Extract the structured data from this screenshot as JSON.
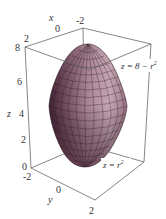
{
  "figure": {
    "surface_color": "#a07888",
    "surface_highlight": "#c7a6b4",
    "surface_shadow": "#4a2a3c",
    "edge_color": "#666666"
  },
  "axes": {
    "x": {
      "label": "x",
      "ticks": [
        "-2",
        "0",
        "2"
      ]
    },
    "y": {
      "label": "y",
      "ticks": [
        "-2",
        "0",
        "2"
      ]
    },
    "z": {
      "label": "z",
      "ticks": [
        "0",
        "2",
        "4",
        "6",
        "8"
      ]
    }
  },
  "annotations": {
    "top_surface": "z = 8 − r",
    "top_exp": "2",
    "bottom_surface": "z = r",
    "bottom_exp": "2"
  }
}
